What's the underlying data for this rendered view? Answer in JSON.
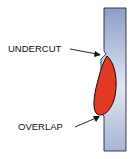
{
  "diagram": {
    "labels": {
      "undercut": "UNDERCUT",
      "overlap": "OVERLAP"
    },
    "colors": {
      "plate_top": "#8f9fc8",
      "plate_bottom": "#eef1f8",
      "plate_outline": "#2a2a3a",
      "bead_fill": "#e23a22",
      "bead_outline": "#1a0a08",
      "text": "#111111"
    }
  }
}
